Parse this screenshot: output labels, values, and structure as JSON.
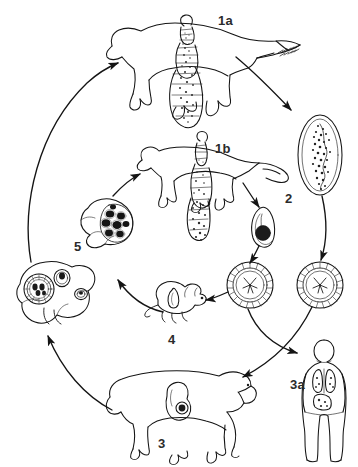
{
  "figure": {
    "type": "life-cycle-diagram",
    "background_color": "#ffffff",
    "line_color": "#1a1a1a",
    "label_color": "#2b2b2b",
    "width": 358,
    "height": 467
  },
  "labels": [
    {
      "id": "1a",
      "text": "1a",
      "x": 218,
      "y": 14,
      "refers_to": "dog-definitive-host"
    },
    {
      "id": "1b",
      "text": "1b",
      "x": 215,
      "y": 142,
      "refers_to": "fox-definitive-host"
    },
    {
      "id": "2",
      "text": "2",
      "x": 285,
      "y": 192,
      "refers_to": "gravid-proglottid"
    },
    {
      "id": "3",
      "text": "3",
      "x": 158,
      "y": 437,
      "refers_to": "sheep-intermediate-host"
    },
    {
      "id": "3a",
      "text": "3a",
      "x": 290,
      "y": 378,
      "refers_to": "human-accidental-host"
    },
    {
      "id": "4",
      "text": "4",
      "x": 168,
      "y": 333,
      "refers_to": "rodent-intermediate-host"
    },
    {
      "id": "5",
      "text": "5",
      "x": 74,
      "y": 240,
      "refers_to": "alveolar-cyst-liver"
    }
  ],
  "nodes": [
    {
      "name": "dog-definitive-host",
      "label": "1a",
      "description": "Dog outline with adult tapeworm",
      "x": 180,
      "y": 65
    },
    {
      "name": "fox-definitive-host",
      "label": "1b",
      "description": "Fox outline with adult tapeworm",
      "x": 185,
      "y": 175
    },
    {
      "name": "adult-tapeworm-dog",
      "label": "",
      "description": "Adult tapeworm in dog intestine",
      "x": 190,
      "y": 80
    },
    {
      "name": "adult-tapeworm-fox",
      "label": "",
      "description": "Adult tapeworm in fox intestine",
      "x": 196,
      "y": 190
    },
    {
      "name": "gravid-proglottid",
      "label": "2",
      "description": "Gravid proglottid segment",
      "x": 320,
      "y": 155
    },
    {
      "name": "small-proglottid",
      "label": "",
      "description": "Small gravid proglottid with egg mass",
      "x": 262,
      "y": 228
    },
    {
      "name": "egg-left",
      "label": "",
      "description": "Embryonated egg with oncosphere",
      "x": 250,
      "y": 285
    },
    {
      "name": "egg-right",
      "label": "",
      "description": "Embryonated egg with oncosphere",
      "x": 320,
      "y": 285
    },
    {
      "name": "rodent-intermediate-host",
      "label": "4",
      "description": "Rodent with larval cyst",
      "x": 178,
      "y": 300
    },
    {
      "name": "alveolar-cyst-liver",
      "label": "5",
      "description": "Liver with multilocular alveolar cysts",
      "x": 104,
      "y": 228
    },
    {
      "name": "hydatid-cyst-liver",
      "label": "",
      "description": "Liver with unilocular hydatid cysts",
      "x": 52,
      "y": 294
    },
    {
      "name": "sheep-intermediate-host",
      "label": "3",
      "description": "Sheep with hydatid cyst in liver",
      "x": 175,
      "y": 400
    },
    {
      "name": "human-accidental-host",
      "label": "3a",
      "description": "Human body with cysts in lungs and liver",
      "x": 325,
      "y": 400
    }
  ],
  "arrows": [
    {
      "name": "arrow-liver-to-dog",
      "from": "hydatid-cyst-liver",
      "to": "dog-definitive-host"
    },
    {
      "name": "arrow-dog-to-proglottid",
      "from": "dog-definitive-host",
      "to": "gravid-proglottid"
    },
    {
      "name": "arrow-fox-to-proglottid",
      "from": "fox-definitive-host",
      "to": "small-proglottid"
    },
    {
      "name": "arrow-proglottid-to-egg-right",
      "from": "gravid-proglottid",
      "to": "egg-right"
    },
    {
      "name": "arrow-small-proglottid-to-egg-left",
      "from": "small-proglottid",
      "to": "egg-left"
    },
    {
      "name": "arrow-egg-left-to-rodent",
      "from": "egg-left",
      "to": "rodent-intermediate-host"
    },
    {
      "name": "arrow-egg-left-to-human",
      "from": "egg-left",
      "to": "human-accidental-host"
    },
    {
      "name": "arrow-egg-right-to-sheep",
      "from": "egg-right",
      "to": "sheep-intermediate-host"
    },
    {
      "name": "arrow-rodent-to-alveolar-cyst",
      "from": "rodent-intermediate-host",
      "to": "alveolar-cyst-liver"
    },
    {
      "name": "arrow-alveolar-cyst-to-fox",
      "from": "alveolar-cyst-liver",
      "to": "fox-definitive-host"
    },
    {
      "name": "arrow-sheep-to-hydatid-liver",
      "from": "sheep-intermediate-host",
      "to": "hydatid-cyst-liver"
    }
  ]
}
